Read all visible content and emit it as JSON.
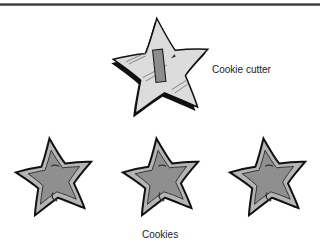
{
  "figure": {
    "cutter_label": "Cookie cutter",
    "cookies_label": "Cookies",
    "cookie_count": 3
  },
  "colors": {
    "rule": "#3a3a3a",
    "cutter_fill": "#d9d9d9",
    "cutter_edge": "#111111",
    "handle_fill": "#8c8c8c",
    "cookie_outer": "#b5b5b5",
    "cookie_inner": "#8f8f8f",
    "outline": "#111111"
  }
}
